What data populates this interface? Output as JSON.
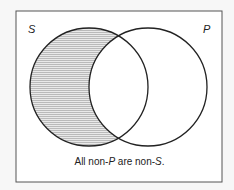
{
  "diagram": {
    "type": "venn",
    "left_set": {
      "label": "S",
      "cx": 89,
      "cy": 87,
      "r": 59,
      "shaded_region": "S minus P"
    },
    "right_set": {
      "label": "P",
      "cx": 148,
      "cy": 87,
      "r": 59
    },
    "caption_parts": [
      "All non-",
      "P",
      " are non-",
      "S",
      "."
    ],
    "colors": {
      "border": "#333333",
      "shade": "#bbbbbb",
      "background": "#ffffff"
    }
  }
}
